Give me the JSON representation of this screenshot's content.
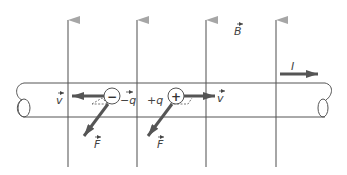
{
  "diagram": {
    "field": {
      "label": "B",
      "vector": true,
      "direction": "up",
      "line_color": "#a6a6a6",
      "line_x": [
        68,
        137,
        206,
        276
      ]
    },
    "current": {
      "label": "I",
      "direction": "right"
    },
    "charges": [
      {
        "sign": "−",
        "label": "−q",
        "velocity_label": "v",
        "force_label": "F",
        "velocity_dir": "left"
      },
      {
        "sign": "+",
        "label": "+q",
        "velocity_label": "v",
        "force_label": "F",
        "velocity_dir": "right"
      }
    ],
    "colors": {
      "arrow": "#555555",
      "conductor": "#555555",
      "field": "#a6a6a6"
    }
  }
}
